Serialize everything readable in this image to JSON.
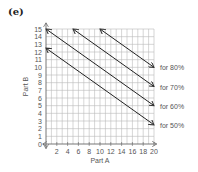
{
  "figure_label": "(e)",
  "chart_data": {
    "type": "line",
    "title": "",
    "xlabel": "Part A",
    "ylabel": "Part B",
    "xlim": [
      0,
      20
    ],
    "ylim": [
      0,
      15
    ],
    "x_ticks": [
      0,
      2,
      4,
      6,
      8,
      10,
      12,
      14,
      16,
      18,
      20
    ],
    "x_tick_labels": [
      "2",
      "4",
      "6",
      "8",
      "10",
      "12",
      "14",
      "16",
      "18",
      "20"
    ],
    "y_ticks": [
      0,
      1,
      2,
      3,
      4,
      5,
      6,
      7,
      8,
      9,
      10,
      11,
      12,
      13,
      14,
      15
    ],
    "origin_label": "0",
    "grid": true,
    "legend_position": "right, inline labels",
    "series": [
      {
        "name": "for 50%",
        "x": [
          0,
          20
        ],
        "y": [
          12.5,
          2.5
        ]
      },
      {
        "name": "for 60%",
        "x": [
          0,
          20
        ],
        "y": [
          15,
          5
        ]
      },
      {
        "name": "for 70%",
        "x": [
          5,
          20
        ],
        "y": [
          15,
          7.5
        ]
      },
      {
        "name": "for 80%",
        "x": [
          10,
          20
        ],
        "y": [
          15,
          10
        ]
      }
    ]
  }
}
